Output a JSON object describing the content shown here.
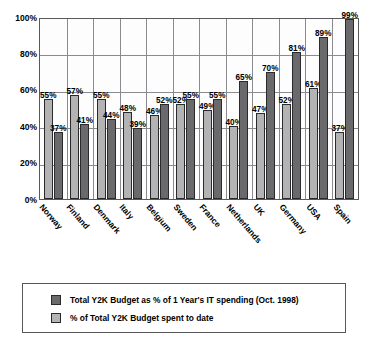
{
  "chart_data": {
    "type": "bar",
    "title": "",
    "xlabel": "",
    "ylabel": "Y2K as a Percentage of Annual IT Spending",
    "ylim": [
      0,
      100
    ],
    "ytick_labels": [
      "100%",
      "80%",
      "60%",
      "40%",
      "20%",
      "0%"
    ],
    "ytick_values": [
      100,
      80,
      60,
      40,
      20,
      0
    ],
    "grid": true,
    "legend_position": "bottom",
    "categories": [
      "Norway",
      "Finland",
      "Denmark",
      "Italy",
      "Belgium",
      "Sweden",
      "France",
      "Netherlands",
      "UK",
      "Germany",
      "USA",
      "Spain"
    ],
    "series": [
      {
        "name": "% of Total Y2K Budget spent to date",
        "color": "#b3b3b3",
        "values": [
          55,
          57,
          55,
          48,
          46,
          52,
          49,
          40,
          47,
          52,
          61,
          37
        ],
        "value_labels": [
          "55%",
          "57%",
          "55%",
          "48%",
          "46%",
          "52%",
          "49%",
          "40%",
          "47%",
          "52%",
          "61%",
          "37%"
        ]
      },
      {
        "name": "Total Y2K Budget as % of 1 Year's IT spending (Oct. 1998)",
        "color": "#6a6a6c",
        "values": [
          37,
          41,
          44,
          39,
          52,
          55,
          55,
          65,
          70,
          81,
          89,
          99
        ],
        "value_labels": [
          "37%",
          "41%",
          "44%",
          "39%",
          "52%",
          "55%",
          "55%",
          "65%",
          "70%",
          "81%",
          "89%",
          "99%"
        ]
      }
    ]
  },
  "legend": {
    "items": [
      {
        "label": "Total Y2K Budget as % of 1 Year's IT spending (Oct. 1998)",
        "swatch": "total"
      },
      {
        "label": "% of Total Y2K Budget spent to date",
        "swatch": "spent"
      }
    ]
  }
}
